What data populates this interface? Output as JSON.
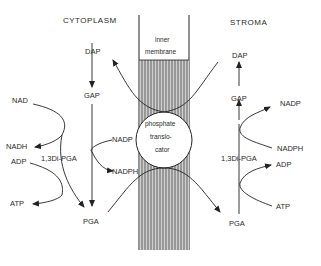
{
  "diagram": {
    "regions": {
      "left": "CYTOPLASM",
      "right": "STROMA",
      "membrane": [
        "inner",
        "membrane"
      ],
      "translocator": [
        "phosphate",
        "translo-",
        "cator"
      ]
    },
    "cytoplasm": {
      "dap": "DAP",
      "gap": "GAP",
      "nad": "NAD",
      "nadh": "NADH",
      "adp": "ADP",
      "atp": "ATP",
      "bpga": "1,3Di-PGA",
      "pga": "PGA",
      "nadp": "NADP",
      "nadph": "NADPH"
    },
    "stroma": {
      "dap": "DAP",
      "gap": "GAP",
      "nadp": "NADP",
      "nadph": "NADPH",
      "bpga": "1,3Di-PGA",
      "adp": "ADP",
      "atp": "ATP",
      "pga": "PGA"
    },
    "colors": {
      "line": "#222222",
      "hatch": "#555555",
      "background": "#ffffff"
    }
  }
}
